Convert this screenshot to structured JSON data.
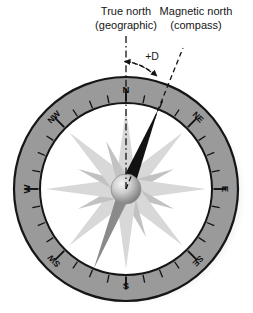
{
  "figure": {
    "type": "compass-declination-diagram",
    "title_visible": false
  },
  "annotations": {
    "true_north": {
      "line1": "True north",
      "line2": "(geographic)"
    },
    "magnetic_north": {
      "line1": "Magnetic north",
      "line2": "(compass)"
    },
    "declination_label": "+D"
  },
  "compass": {
    "bezel_labels": [
      {
        "text": "N",
        "bearing": 0
      },
      {
        "text": "NE",
        "bearing": 45
      },
      {
        "text": "E",
        "bearing": 90
      },
      {
        "text": "SE",
        "bearing": 135
      },
      {
        "text": "S",
        "bearing": 180
      },
      {
        "text": "SW",
        "bearing": 225
      },
      {
        "text": "W",
        "bearing": 270
      },
      {
        "text": "NW",
        "bearing": 315
      }
    ],
    "needle": {
      "north_bearing_deg": 22,
      "north_color": "#121212",
      "south_color": "#8a8a8a"
    },
    "tick_count": 32
  },
  "colors": {
    "bezel_fill": "#9a9a9a",
    "bezel_stroke": "#161616",
    "face_fill": "#ffffff",
    "rose_ray_light": "#d8d8d8",
    "rose_ray_mid": "#c2c2c2",
    "hub_light": "#efefef",
    "hub_dark": "#7e7e7e",
    "annotation_line": "#141414",
    "shadow": "#d7d7d7"
  }
}
